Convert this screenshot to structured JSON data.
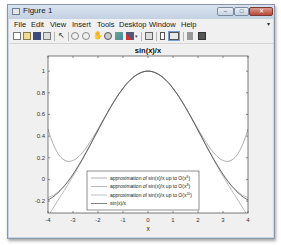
{
  "window": {
    "title": "Figure 1",
    "controls": {
      "minimize": "–",
      "maximize": "□",
      "close": "✕"
    }
  },
  "menubar": {
    "items": [
      "File",
      "Edit",
      "View",
      "Insert",
      "Tools",
      "Desktop",
      "Window",
      "Help"
    ],
    "overflow_arrow": "▾"
  },
  "toolbar": {
    "buttons": [
      "new-figure",
      "open-file",
      "save-figure",
      "print-figure",
      "edit-plot",
      "zoom-in",
      "zoom-out",
      "pan",
      "rotate-3d",
      "data-cursor",
      "brush",
      "brush-dropdown",
      "link-plot",
      "insert-colorbar",
      "insert-legend",
      "hide-plot-tools",
      "show-plot-tools"
    ]
  },
  "chart_data": {
    "type": "line",
    "title": "sin(x)/x",
    "xlabel": "x",
    "ylabel": "",
    "xlim": [
      -4,
      4
    ],
    "ylim": [
      -0.31,
      1.14
    ],
    "xticks": [
      -4,
      -3,
      -2,
      -1,
      0,
      1,
      2,
      3,
      4
    ],
    "xtick_labels": [
      "-4",
      "-3",
      "-2",
      "-1",
      "0",
      "1",
      "2",
      "3",
      "4"
    ],
    "yticks": [
      -0.2,
      0,
      0.2,
      0.4,
      0.6,
      0.8,
      1
    ],
    "ytick_labels": [
      "-0.2",
      "0",
      "0.2",
      "0.4",
      "0.6",
      "0.8",
      "1"
    ],
    "grid": false,
    "legend_position": "lower center (inside)",
    "series": [
      {
        "name": "approximation of sin(x)/x up to O(x^6)",
        "label_main": "approximation of sin(x)/x up to O(x",
        "label_sup": "6",
        "label_end": ")",
        "coefficients": [
          1,
          -0.16666667,
          0.00833333
        ],
        "color": "#8c8c8c",
        "x": [
          -4,
          -3,
          -2,
          -1,
          0,
          1,
          2,
          3,
          4
        ],
        "values": [
          0.4667,
          0.175,
          0.4667,
          0.8417,
          1.0,
          0.8417,
          0.4667,
          0.175,
          0.4667
        ]
      },
      {
        "name": "approximation of sin(x)/x up to O(x^8)",
        "label_main": "approximation of sin(x)/x up to O(x",
        "label_sup": "8",
        "label_end": ")",
        "coefficients": [
          1,
          -0.16666667,
          0.00833333,
          -0.000198413
        ],
        "color": "#9a9a9a",
        "x": [
          -4,
          -3,
          -2,
          -1,
          0,
          1,
          2,
          3,
          4
        ],
        "values": [
          -0.346,
          0.0304,
          0.454,
          0.8415,
          1.0,
          0.8415,
          0.454,
          0.0304,
          -0.346
        ]
      },
      {
        "name": "approximation of sin(x)/x up to O(x^10)",
        "label_main": "approximation of sin(x)/x up to O(x",
        "label_sup": "10",
        "label_end": ")",
        "coefficients": [
          1,
          -0.16666667,
          0.00833333,
          -0.000198413,
          2.7557e-06
        ],
        "color": "#a8a8a8",
        "x": [
          -4,
          -3,
          -2,
          -1,
          0,
          1,
          2,
          3,
          4
        ],
        "values": [
          -0.1655,
          0.0484,
          0.4547,
          0.8415,
          1.0,
          0.8415,
          0.4547,
          0.0484,
          -0.1655
        ]
      },
      {
        "name": "sin(x)/x",
        "label_main": "sin(x)/x",
        "label_sup": "",
        "label_end": "",
        "color": "#505050",
        "x": [
          -4,
          -3,
          -2,
          -1,
          0,
          1,
          2,
          3,
          4
        ],
        "values": [
          -0.1892,
          0.047,
          0.4546,
          0.8415,
          1.0,
          0.8415,
          0.4546,
          0.047,
          -0.1892
        ]
      }
    ]
  }
}
